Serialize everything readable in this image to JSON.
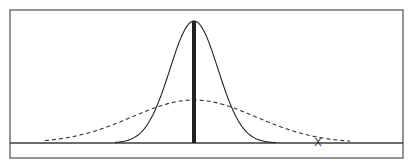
{
  "diagram": {
    "frame": {
      "x": 10,
      "y": 10,
      "width": 393,
      "height": 148
    },
    "baseline_y": 143,
    "center_x": 194,
    "narrow_curve": {
      "style": "solid",
      "peak_y": 21,
      "left_x": 115,
      "right_x": 276,
      "sigma_px": 24
    },
    "wide_curve": {
      "style": "dashed",
      "peak_y": 100,
      "left_x": 45,
      "right_x": 350,
      "sigma_px": 62
    },
    "center_line": {
      "style": "thick",
      "top_y": 21,
      "bottom_y": 143
    },
    "marker": {
      "label": "X",
      "x": 318,
      "y": 143
    }
  }
}
